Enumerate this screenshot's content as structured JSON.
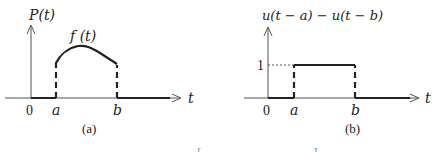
{
  "panels": [
    {
      "caption": "(a)",
      "y_label": "P(t)",
      "curve_label": "f (t)",
      "x_label": "t",
      "ticks": [
        "0",
        "a",
        "b"
      ]
    },
    {
      "caption": "(b)",
      "y_label": "u(t − a) − u(t − b)",
      "level_label": "1",
      "x_label": "t",
      "ticks": [
        "0",
        "a",
        "b"
      ]
    }
  ],
  "footer": {
    "left_bracket": "[",
    "right_bracket": "]"
  }
}
